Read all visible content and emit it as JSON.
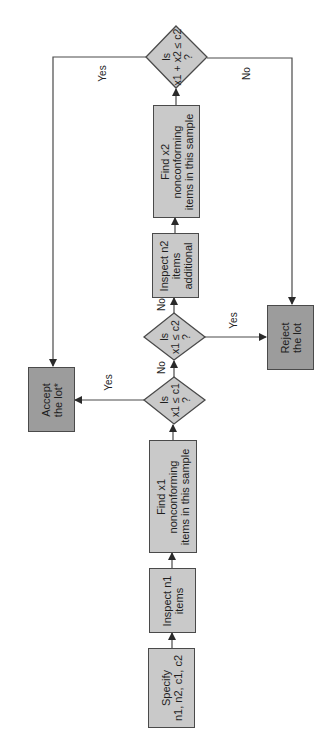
{
  "diagram": {
    "type": "flowchart",
    "orientation": "rotated-90-ccw",
    "colors": {
      "process_fill": "#c9c9c9",
      "terminal_fill": "#9c9c9c",
      "stroke": "#4a4a4a"
    },
    "nodes": {
      "specify": {
        "lines": [
          "Specify",
          "n1, n2, c1, c2"
        ]
      },
      "inspect_n1": {
        "lines": [
          "Inspect n1",
          "items"
        ]
      },
      "find_x1": {
        "lines": [
          "Find x1",
          "nonconforming",
          "items in this sample"
        ]
      },
      "decision_1": {
        "lines": [
          "Is",
          "x1 ≤ c1",
          "?"
        ]
      },
      "decision_2": {
        "lines": [
          "Is",
          "x1 ≤ c2",
          "?"
        ]
      },
      "inspect_n2": {
        "lines": [
          "Inspect n2",
          "items",
          "additional"
        ]
      },
      "find_x2": {
        "lines": [
          "Find x2",
          "nonconforming",
          "items in this sample"
        ]
      },
      "decision_3": {
        "lines": [
          "Is",
          "x1 + x2 ≤ c2",
          "?"
        ]
      },
      "accept": {
        "lines": [
          "Accept",
          "the lot*"
        ]
      },
      "reject": {
        "lines": [
          "Reject",
          "the lot"
        ]
      }
    },
    "edge_labels": {
      "d1_yes": "Yes",
      "d1_no": "No",
      "d2_yes": "Yes",
      "d2_no": "No",
      "d3_yes": "Yes",
      "d3_no": "No"
    }
  }
}
